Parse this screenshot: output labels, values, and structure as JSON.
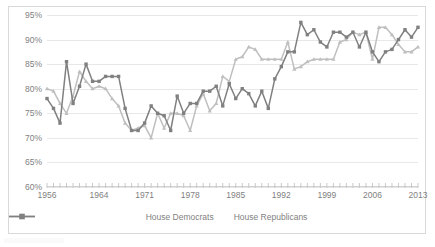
{
  "chart_data": {
    "type": "line",
    "title": "",
    "xlabel": "",
    "ylabel": "",
    "ylim": [
      60,
      95
    ],
    "ytick_labels": [
      "60%",
      "65%",
      "70%",
      "75%",
      "80%",
      "85%",
      "90%",
      "95%"
    ],
    "ytick_values": [
      60,
      65,
      70,
      75,
      80,
      85,
      90,
      95
    ],
    "grid": true,
    "legend_position": "bottom-center",
    "xlim": [
      1956,
      2013
    ],
    "xtick_labels": [
      "1956",
      "1964",
      "1971",
      "1978",
      "1985",
      "1992",
      "1999",
      "2006",
      "2013"
    ],
    "xtick_values": [
      1956,
      1964,
      1971,
      1978,
      1985,
      1992,
      1999,
      2006,
      2013
    ],
    "x": [
      1956,
      1957,
      1958,
      1959,
      1960,
      1961,
      1962,
      1963,
      1964,
      1965,
      1966,
      1967,
      1968,
      1969,
      1970,
      1971,
      1972,
      1973,
      1974,
      1975,
      1976,
      1977,
      1978,
      1979,
      1980,
      1981,
      1982,
      1983,
      1984,
      1985,
      1986,
      1987,
      1988,
      1989,
      1990,
      1991,
      1992,
      1993,
      1994,
      1995,
      1996,
      1997,
      1998,
      1999,
      2000,
      2001,
      2002,
      2003,
      2004,
      2005,
      2006,
      2007,
      2008,
      2009,
      2010,
      2011,
      2012,
      2013
    ],
    "series": [
      {
        "name": "House Democrats",
        "color": "#bfbfbf",
        "marker": "triangle",
        "values": [
          80.0,
          79.5,
          77.0,
          75.0,
          78.5,
          83.5,
          81.5,
          80.0,
          80.5,
          80.0,
          78.0,
          76.5,
          73.0,
          71.5,
          72.0,
          72.5,
          70.0,
          75.0,
          72.0,
          75.0,
          75.0,
          74.5,
          71.5,
          76.5,
          79.0,
          75.5,
          77.0,
          82.5,
          81.5,
          86.0,
          86.5,
          88.5,
          88.0,
          86.0,
          86.0,
          86.0,
          86.0,
          89.5,
          84.0,
          84.5,
          85.5,
          86.0,
          86.0,
          86.0,
          86.0,
          89.5,
          90.0,
          91.5,
          91.0,
          91.5,
          86.0,
          92.5,
          92.5,
          91.0,
          89.0,
          87.5,
          87.5,
          88.5
        ]
      },
      {
        "name": "House Republicans",
        "color": "#808080",
        "marker": "square",
        "values": [
          78.0,
          76.0,
          73.0,
          85.5,
          77.0,
          80.5,
          85.0,
          81.5,
          81.5,
          82.5,
          82.5,
          82.5,
          76.0,
          71.5,
          71.5,
          73.0,
          76.5,
          75.0,
          74.5,
          71.5,
          78.5,
          75.0,
          77.0,
          77.0,
          79.5,
          79.5,
          80.5,
          76.5,
          81.0,
          78.0,
          80.0,
          79.0,
          76.5,
          79.5,
          76.0,
          82.0,
          84.5,
          87.5,
          87.5,
          93.5,
          91.0,
          92.0,
          89.5,
          88.5,
          91.5,
          91.5,
          90.5,
          91.5,
          88.5,
          91.5,
          87.5,
          85.5,
          87.5,
          88.0,
          90.0,
          92.0,
          90.5,
          92.5
        ]
      }
    ]
  },
  "legend": {
    "items": [
      {
        "label": "House Democrats"
      },
      {
        "label": "House Republicans"
      }
    ]
  }
}
